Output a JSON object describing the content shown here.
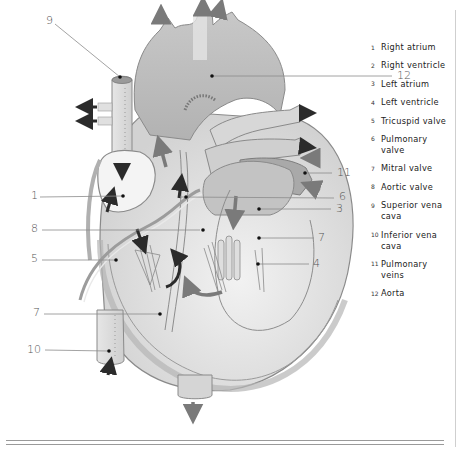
{
  "diagram": {
    "callouts": [
      {
        "num": "9",
        "x": 46,
        "y": 15
      },
      {
        "num": "12",
        "x": 397,
        "y": 71
      },
      {
        "num": "1",
        "x": 31,
        "y": 190
      },
      {
        "num": "6",
        "x": 339,
        "y": 192
      },
      {
        "num": "3",
        "x": 336,
        "y": 204
      },
      {
        "num": "11",
        "x": 337,
        "y": 172
      },
      {
        "num": "8",
        "x": 31,
        "y": 222
      },
      {
        "num": "7",
        "x": 319,
        "y": 231
      },
      {
        "num": "5",
        "x": 31,
        "y": 252
      },
      {
        "num": "4",
        "x": 314,
        "y": 257
      },
      {
        "num": "7",
        "x": 32,
        "y": 307
      },
      {
        "num": "10",
        "x": 27,
        "y": 344
      }
    ]
  },
  "legend": {
    "items": [
      {
        "num": "1",
        "label": "Right atrium"
      },
      {
        "num": "2",
        "label": "Right ventricle"
      },
      {
        "num": "3",
        "label": "Left atrium"
      },
      {
        "num": "4",
        "label": "Left ventricle"
      },
      {
        "num": "5",
        "label": "Tricuspid valve"
      },
      {
        "num": "6",
        "label": "Pulmonary valve"
      },
      {
        "num": "7",
        "label": "Mitral valve"
      },
      {
        "num": "8",
        "label": "Aortic valve"
      },
      {
        "num": "9",
        "label": "Superior vena cava"
      },
      {
        "num": "10",
        "label": "Inferior vena cava"
      },
      {
        "num": "11",
        "label": "Pulmonary veins"
      },
      {
        "num": "12",
        "label": "Aorta"
      }
    ]
  },
  "colors": {
    "aorta": "#bdbdbd",
    "vessel_light": "#dcdcdc",
    "wall": "#a8a8a8",
    "arrow_dark": "#2b2b2b",
    "arrow_mid": "#7a7a7a",
    "line": "#8c8c8c"
  }
}
